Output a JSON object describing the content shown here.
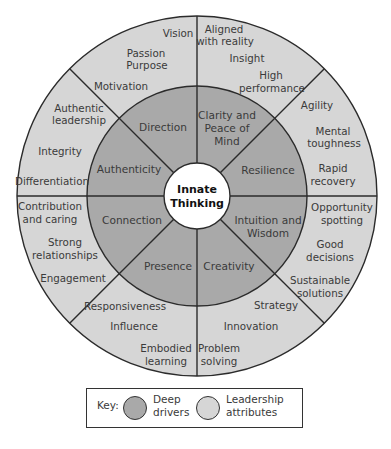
{
  "colors": {
    "deep_drivers_fill": "#a9a9a9",
    "leadership_fill": "#d6d6d6",
    "core_fill": "#ffffff",
    "line": "#2b2b2b"
  },
  "core": {
    "line1": "Innate",
    "line2": "Thinking"
  },
  "deep_drivers": [
    {
      "name": "Direction",
      "lines": [
        "Direction"
      ]
    },
    {
      "name": "Clarity and Peace of Mind",
      "lines": [
        "Clarity and",
        "Peace of",
        "Mind"
      ]
    },
    {
      "name": "Resilience",
      "lines": [
        "Resilience"
      ]
    },
    {
      "name": "Intuition and Wisdom",
      "lines": [
        "Intuition and",
        "Wisdom"
      ]
    },
    {
      "name": "Creativity",
      "lines": [
        "Creativity"
      ]
    },
    {
      "name": "Presence",
      "lines": [
        "Presence"
      ]
    },
    {
      "name": "Connection",
      "lines": [
        "Connection"
      ]
    },
    {
      "name": "Authenticity",
      "lines": [
        "Authenticity"
      ]
    }
  ],
  "leadership_attributes": {
    "direction": [
      "Vision",
      "Passion Purpose",
      "Motivation"
    ],
    "clarity": [
      "Aligned with reality",
      "Insight",
      "High performance"
    ],
    "resilience": [
      "Agility",
      "Mental toughness",
      "Rapid recovery"
    ],
    "intuition": [
      "Opportunity spotting",
      "Good decisions",
      "Sustainable solutions"
    ],
    "creativity": [
      "Strategy",
      "Innovation",
      "Problem solving"
    ],
    "presence": [
      "Responsiveness",
      "Influence",
      "Embodied learning"
    ],
    "connection": [
      "Contribution and caring",
      "Strong relationships",
      "Engagement"
    ],
    "authenticity": [
      "Authentic leadership",
      "Integrity",
      "Differentiation"
    ]
  },
  "text": {
    "vision": "Vision",
    "passion": "Passion",
    "purpose": "Purpose",
    "motivation": "Motivation",
    "aligned1": "Aligned",
    "aligned2": "with reality",
    "insight": "Insight",
    "high1": "High",
    "high2": "performance",
    "agility": "Agility",
    "mental1": "Mental",
    "mental2": "toughness",
    "rapid1": "Rapid",
    "rapid2": "recovery",
    "opp1": "Opportunity",
    "opp2": "spotting",
    "good1": "Good",
    "good2": "decisions",
    "sust1": "Sustainable",
    "sust2": "solutions",
    "strategy": "Strategy",
    "innovation": "Innovation",
    "problem1": "Problem",
    "problem2": "solving",
    "responsiveness": "Responsiveness",
    "influence": "Influence",
    "embodied1": "Embodied",
    "embodied2": "learning",
    "contrib1": "Contribution",
    "contrib2": "and caring",
    "strong1": "Strong",
    "strong2": "relationships",
    "engagement": "Engagement",
    "auth1": "Authentic",
    "auth2": "leadership",
    "integrity": "Integrity",
    "differentiation": "Differentiation",
    "d_direction": "Direction",
    "d_clarity1": "Clarity and",
    "d_clarity2": "Peace of",
    "d_clarity3": "Mind",
    "d_resilience": "Resilience",
    "d_intuition1": "Intuition and",
    "d_intuition2": "Wisdom",
    "d_creativity": "Creativity",
    "d_presence": "Presence",
    "d_connection": "Connection",
    "d_authenticity": "Authenticity"
  },
  "legend": {
    "key_label": "Key:",
    "deep_line1": "Deep",
    "deep_line2": "drivers",
    "leader_line1": "Leadership",
    "leader_line2": "attributes"
  }
}
